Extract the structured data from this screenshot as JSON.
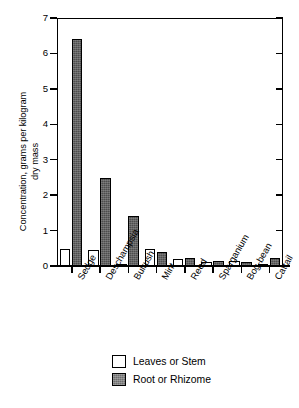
{
  "chart_data": {
    "type": "bar",
    "title": "",
    "xlabel": "",
    "ylabel_line1": "Concentration, grams per kilogram",
    "ylabel_line2": "dry mass",
    "categories": [
      "Sedge",
      "Deschampsia",
      "Bulrush",
      "Mint",
      "Reed",
      "Sparganium",
      "Bog-bean",
      "Cattail"
    ],
    "series": [
      {
        "name": "Leaves or Stem",
        "color": "#ffffff",
        "values": [
          0.47,
          0.46,
          0.07,
          0.47,
          0.2,
          0.1,
          0.15,
          0.05
        ]
      },
      {
        "name": "Root or Rhizome",
        "color": "#4d4d4d",
        "values": [
          6.4,
          2.48,
          1.41,
          0.4,
          0.22,
          0.15,
          0.1,
          0.22
        ]
      }
    ],
    "ylim": [
      0,
      7
    ],
    "yticks": [
      0,
      1,
      2,
      3,
      4,
      5,
      6,
      7
    ],
    "ytick_labels": [
      "0",
      "1",
      "2",
      "3",
      "4",
      "5",
      "6",
      "7"
    ],
    "grid": false,
    "legend_position": "bottom"
  },
  "legend": {
    "items": [
      {
        "label": "Leaves or Stem",
        "swatch": "white-square"
      },
      {
        "label": "Root or Rhizome",
        "swatch": "gray-square"
      }
    ]
  }
}
